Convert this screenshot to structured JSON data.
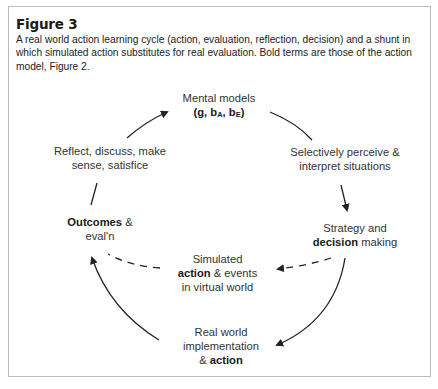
{
  "figure": {
    "title": "Figure 3",
    "caption": "A real world action learning cycle (action, evaluation, reflection, decision) and a shunt in which simulated action substitutes for real evaluation.  Bold terms are those of the action model, Figure 2."
  },
  "nodes": {
    "mental_models": {
      "line1": "Mental models",
      "formula_open": "(g, b",
      "sub_a": "A",
      "formula_mid": ", b",
      "sub_e": "E",
      "formula_close": ")"
    },
    "perceive": {
      "line1": "Selectively perceive &",
      "line2": "interpret situations"
    },
    "strategy": {
      "line1": "Strategy and",
      "bold": "decision",
      "rest": " making"
    },
    "simulated": {
      "line1": "Simulated",
      "bold": "action",
      "rest": " & events",
      "line3": "in virtual world"
    },
    "real_world": {
      "line1": "Real world",
      "line2": "implementation",
      "prefix": "& ",
      "bold": "action"
    },
    "outcomes": {
      "bold": "Outcomes",
      "rest": " &",
      "line2": "eval'n"
    },
    "reflect": {
      "line1": "Reflect, discuss, make",
      "line2": "sense, satisfice"
    }
  },
  "edges": [
    {
      "from": "mental_models",
      "to": "perceive",
      "style": "solid",
      "arrowhead": false
    },
    {
      "from": "perceive",
      "to": "strategy",
      "style": "solid",
      "arrowhead": true
    },
    {
      "from": "strategy",
      "to": "real_world",
      "style": "solid",
      "arrowhead": true
    },
    {
      "from": "real_world",
      "to": "outcomes",
      "style": "solid",
      "arrowhead": true
    },
    {
      "from": "outcomes",
      "to": "reflect",
      "style": "solid",
      "arrowhead": false
    },
    {
      "from": "reflect",
      "to": "mental_models",
      "style": "solid",
      "arrowhead": true
    },
    {
      "from": "strategy",
      "to": "simulated",
      "style": "dashed",
      "arrowhead": true
    },
    {
      "from": "simulated",
      "to": "outcomes",
      "style": "dashed",
      "arrowhead": false
    }
  ],
  "colors": {
    "line": "#222222",
    "text": "#333333",
    "border": "#bdbdbd"
  }
}
